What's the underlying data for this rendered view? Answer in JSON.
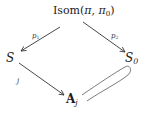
{
  "diagram": {
    "type": "commutative-diagram",
    "nodes": {
      "top": {
        "prefix": "Isom(",
        "arg1": "π",
        "sep": ", ",
        "arg2": "π",
        "arg2_sub": "0",
        "suffix": ")"
      },
      "left": {
        "main": "S"
      },
      "right": {
        "main": "S",
        "sub": "0"
      },
      "bottom": {
        "main": "A",
        "sub": "j"
      }
    },
    "edges": [
      {
        "from": "top",
        "to": "left",
        "label": "p1",
        "label_main": "p",
        "label_sub": "1"
      },
      {
        "from": "top",
        "to": "right",
        "label": "p2",
        "label_main": "p",
        "label_sub": "2"
      },
      {
        "from": "left",
        "to": "bottom",
        "label": "j"
      },
      {
        "from": "bottom",
        "to": "right",
        "label": "",
        "style": "double-line loop"
      }
    ],
    "colors": {
      "stroke": "#333333",
      "text": "#1a1a1a",
      "background": "#ffffff"
    }
  }
}
